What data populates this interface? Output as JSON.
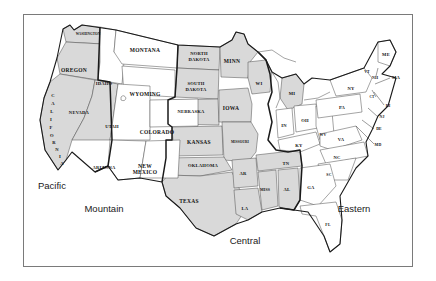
{
  "figure": {
    "frame_color": "#7a7a7a",
    "background_color": "#ffffff"
  },
  "legend": {
    "gray_fill": "#d9d9d9",
    "white_fill": "#ffffff",
    "gray_meaning": "Pacific and Central time zones shaded",
    "white_meaning": "Mountain and Eastern time zones unshaded"
  },
  "time_zones": [
    {
      "id": "pacific",
      "label": "Pacific",
      "x": 52,
      "y": 186,
      "shaded": true
    },
    {
      "id": "mountain",
      "label": "Mountain",
      "x": 104,
      "y": 209,
      "shaded": false
    },
    {
      "id": "central",
      "label": "Central",
      "x": 245,
      "y": 241,
      "shaded": true
    },
    {
      "id": "eastern",
      "label": "Eastern",
      "x": 354,
      "y": 209,
      "shaded": false
    }
  ],
  "states": [
    {
      "code": "WA",
      "label": "WASHINGTON",
      "zone": "Pacific",
      "shaded": true,
      "x": 88,
      "y": 34,
      "size": "lbl-tiny"
    },
    {
      "code": "OR",
      "label": "OREGON",
      "zone": "Pacific",
      "shaded": true,
      "x": 74,
      "y": 71,
      "size": "lbl-md"
    },
    {
      "code": "CA",
      "label": "CALIFORNIA",
      "zone": "Pacific",
      "shaded": true,
      "x": 49,
      "y": 128,
      "size": "lbl-sm"
    },
    {
      "code": "NV",
      "label": "NEVADA",
      "zone": "Pacific",
      "shaded": true,
      "x": 79,
      "y": 113,
      "size": "lbl-sm"
    },
    {
      "code": "ID",
      "label": "IDAHO",
      "zone": "Mountain",
      "shaded": false,
      "x": 104,
      "y": 84,
      "size": "lbl-sm"
    },
    {
      "code": "MT",
      "label": "MONTANA",
      "zone": "Mountain",
      "shaded": false,
      "x": 145,
      "y": 51,
      "size": "lbl-md"
    },
    {
      "code": "WY",
      "label": "WYOMING",
      "zone": "Mountain",
      "shaded": false,
      "x": 145,
      "y": 95,
      "size": "lbl-md"
    },
    {
      "code": "UT",
      "label": "UTAH",
      "zone": "Mountain",
      "shaded": false,
      "x": 112,
      "y": 127,
      "size": "lbl-sm"
    },
    {
      "code": "CO",
      "label": "COLORADO",
      "zone": "Mountain",
      "shaded": false,
      "x": 157,
      "y": 133,
      "size": "lbl-md"
    },
    {
      "code": "AZ",
      "label": "ARIZONA",
      "zone": "Mountain",
      "shaded": false,
      "x": 104,
      "y": 168,
      "size": "lbl-sm"
    },
    {
      "code": "NM",
      "label": "NEW MEXICO",
      "zone": "Mountain",
      "shaded": false,
      "x": 145,
      "y": 170,
      "size": "lbl-md"
    },
    {
      "code": "ND",
      "label": "NORTH DAKOTA",
      "zone": "Central",
      "shaded": true,
      "x": 199,
      "y": 57,
      "size": "lbl-sm"
    },
    {
      "code": "SD",
      "label": "SOUTH DAKOTA",
      "zone": "Central",
      "shaded": true,
      "x": 196,
      "y": 87,
      "size": "lbl-sm"
    },
    {
      "code": "NE",
      "label": "NEBRASKA",
      "zone": "Central",
      "shaded": true,
      "x": 191,
      "y": 112,
      "size": "lbl-sm"
    },
    {
      "code": "KS",
      "label": "KANSAS",
      "zone": "Central",
      "shaded": true,
      "x": 199,
      "y": 143,
      "size": "lbl-md"
    },
    {
      "code": "MN",
      "label": "MINN",
      "zone": "Central",
      "shaded": true,
      "x": 232,
      "y": 62,
      "size": "lbl-md"
    },
    {
      "code": "IA",
      "label": "IOWA",
      "zone": "Central",
      "shaded": true,
      "x": 231,
      "y": 109,
      "size": "lbl-md"
    },
    {
      "code": "WI",
      "label": "WI",
      "zone": "Central",
      "shaded": true,
      "x": 259,
      "y": 84,
      "size": "lbl-sm"
    },
    {
      "code": "MO",
      "label": "MISSOURI",
      "zone": "Central",
      "shaded": true,
      "x": 240,
      "y": 142,
      "size": "lbl-tiny"
    },
    {
      "code": "OK",
      "label": "OKLAHOMA",
      "zone": "Central",
      "shaded": true,
      "x": 203,
      "y": 166,
      "size": "lbl-sm"
    },
    {
      "code": "TX",
      "label": "TEXAS",
      "zone": "Central",
      "shaded": true,
      "x": 189,
      "y": 202,
      "size": "lbl-md"
    },
    {
      "code": "AR",
      "label": "AR",
      "zone": "Central",
      "shaded": true,
      "x": 243,
      "y": 174,
      "size": "lbl-sm"
    },
    {
      "code": "LA",
      "label": "LA",
      "zone": "Central",
      "shaded": true,
      "x": 245,
      "y": 209,
      "size": "lbl-sm"
    },
    {
      "code": "MS",
      "label": "MISS",
      "zone": "Central",
      "shaded": true,
      "x": 265,
      "y": 190,
      "size": "lbl-xs"
    },
    {
      "code": "AL",
      "label": "AL",
      "zone": "Central",
      "shaded": true,
      "x": 287,
      "y": 190,
      "size": "lbl-sm"
    },
    {
      "code": "TN",
      "label": "TN",
      "zone": "Central",
      "shaded": true,
      "x": 286,
      "y": 164,
      "size": "lbl-sm"
    },
    {
      "code": "MI",
      "label": "MI",
      "zone": "Eastern",
      "shaded": true,
      "x": 292,
      "y": 94,
      "size": "lbl-sm"
    },
    {
      "code": "IN",
      "label": "IN",
      "zone": "Eastern",
      "shaded": false,
      "x": 284,
      "y": 126,
      "size": "lbl-sm"
    },
    {
      "code": "OH",
      "label": "OH",
      "zone": "Eastern",
      "shaded": false,
      "x": 305,
      "y": 121,
      "size": "lbl-sm"
    },
    {
      "code": "KY",
      "label": "KY",
      "zone": "Eastern",
      "shaded": false,
      "x": 299,
      "y": 146,
      "size": "lbl-sm"
    },
    {
      "code": "WV",
      "label": "WV",
      "zone": "Eastern",
      "shaded": false,
      "x": 323,
      "y": 135,
      "size": "lbl-xs"
    },
    {
      "code": "VA",
      "label": "VA",
      "zone": "Eastern",
      "shaded": false,
      "x": 341,
      "y": 140,
      "size": "lbl-sm"
    },
    {
      "code": "PA",
      "label": "PA",
      "zone": "Eastern",
      "shaded": false,
      "x": 342,
      "y": 108,
      "size": "lbl-sm"
    },
    {
      "code": "NY",
      "label": "NY",
      "zone": "Eastern",
      "shaded": false,
      "x": 351,
      "y": 89,
      "size": "lbl-sm"
    },
    {
      "code": "ME",
      "label": "ME",
      "zone": "Eastern",
      "shaded": false,
      "x": 386,
      "y": 55,
      "size": "lbl-sm"
    },
    {
      "code": "VT",
      "label": "VT",
      "zone": "Eastern",
      "shaded": false,
      "x": 367,
      "y": 72,
      "size": "lbl-xs"
    },
    {
      "code": "NH",
      "label": "NH",
      "zone": "Eastern",
      "shaded": false,
      "x": 375,
      "y": 78,
      "size": "lbl-xs"
    },
    {
      "code": "MA",
      "label": "MA",
      "zone": "Eastern",
      "shaded": false,
      "x": 396,
      "y": 78,
      "size": "lbl-sm"
    },
    {
      "code": "CT",
      "label": "CT",
      "zone": "Eastern",
      "shaded": false,
      "x": 372,
      "y": 97,
      "size": "lbl-tiny"
    },
    {
      "code": "RI",
      "label": "RI",
      "zone": "Eastern",
      "shaded": false,
      "x": 388,
      "y": 106,
      "size": "lbl-xs"
    },
    {
      "code": "NJ",
      "label": "NJ",
      "zone": "Eastern",
      "shaded": false,
      "x": 382,
      "y": 117,
      "size": "lbl-xs"
    },
    {
      "code": "DE",
      "label": "DE",
      "zone": "Eastern",
      "shaded": false,
      "x": 379,
      "y": 129,
      "size": "lbl-xs"
    },
    {
      "code": "MD",
      "label": "MD",
      "zone": "Eastern",
      "shaded": false,
      "x": 378,
      "y": 145,
      "size": "lbl-xs"
    },
    {
      "code": "NC",
      "label": "NC",
      "zone": "Eastern",
      "shaded": false,
      "x": 337,
      "y": 158,
      "size": "lbl-sm"
    },
    {
      "code": "SC",
      "label": "SC",
      "zone": "Eastern",
      "shaded": false,
      "x": 329,
      "y": 175,
      "size": "lbl-xs"
    },
    {
      "code": "GA",
      "label": "GA",
      "zone": "Eastern",
      "shaded": false,
      "x": 311,
      "y": 188,
      "size": "lbl-sm"
    },
    {
      "code": "FL",
      "label": "FL",
      "zone": "Eastern",
      "shaded": false,
      "x": 328,
      "y": 225,
      "size": "lbl-xs"
    }
  ],
  "california_letters": [
    "C",
    "A",
    "L",
    "I",
    "F",
    "O",
    "R",
    "N",
    "I",
    "A"
  ]
}
